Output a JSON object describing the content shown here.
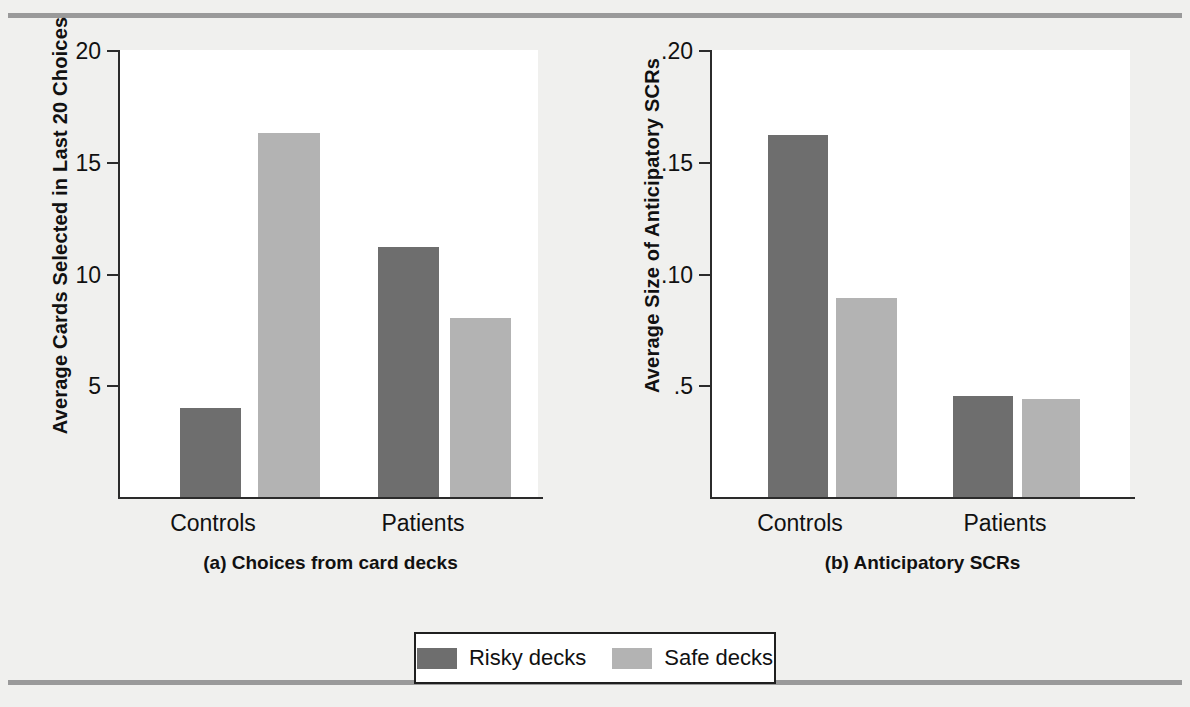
{
  "figure": {
    "background_color": "#f0f0ee",
    "rule_color": "#9a9a9a"
  },
  "legend": {
    "position": "bottom-center",
    "items": [
      {
        "label": "Risky decks",
        "color": "#6e6e6e",
        "key": "risky"
      },
      {
        "label": "Safe decks",
        "color": "#b3b3b3",
        "key": "safe"
      }
    ]
  },
  "panels": [
    {
      "id": "a",
      "caption": "(a) Choices from card decks",
      "ylabel": "Average Cards Selected in Last 20 Choices",
      "ticks": [
        "5",
        "10",
        "15",
        "20"
      ],
      "groups": [
        "Controls",
        "Patients"
      ]
    },
    {
      "id": "b",
      "caption": "(b) Anticipatory SCRs",
      "ylabel": "Average Size of Anticipatory SCRs",
      "ticks": [
        ".5",
        ".10",
        ".15",
        ".20"
      ],
      "groups": [
        "Controls",
        "Patients"
      ]
    }
  ],
  "chart_data": [
    {
      "type": "bar",
      "panel": "a",
      "title": "(a) Choices from card decks",
      "xlabel": "",
      "ylabel": "Average Cards Selected in Last 20 Choices",
      "categories": [
        "Controls",
        "Patients"
      ],
      "series": [
        {
          "name": "Risky decks",
          "color": "#6e6e6e",
          "values": [
            4.0,
            11.2
          ]
        },
        {
          "name": "Safe decks",
          "color": "#b3b3b3",
          "values": [
            16.3,
            8.0
          ]
        }
      ],
      "ylim": [
        0,
        20
      ],
      "yticks": [
        5,
        10,
        15,
        20
      ],
      "ytick_labels": [
        "5",
        "10",
        "15",
        "20"
      ],
      "grid": false,
      "legend_position": "bottom-center"
    },
    {
      "type": "bar",
      "panel": "b",
      "title": "(b) Anticipatory SCRs",
      "xlabel": "",
      "ylabel": "Average Size of Anticipatory SCRs",
      "categories": [
        "Controls",
        "Patients"
      ],
      "series": [
        {
          "name": "Risky decks",
          "color": "#6e6e6e",
          "values": [
            0.162,
            0.045
          ]
        },
        {
          "name": "Safe decks",
          "color": "#b3b3b3",
          "values": [
            0.089,
            0.044
          ]
        }
      ],
      "ylim": [
        0,
        0.2
      ],
      "yticks": [
        0.05,
        0.1,
        0.15,
        0.2
      ],
      "ytick_labels": [
        ".5",
        ".10",
        ".15",
        ".20"
      ],
      "grid": false,
      "legend_position": "bottom-center"
    }
  ]
}
